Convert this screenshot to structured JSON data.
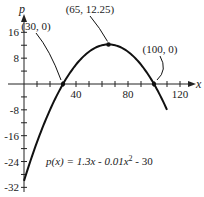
{
  "chart_data": {
    "type": "line",
    "title": "",
    "xlabel": "x",
    "ylabel": "p",
    "function": "p(x) = 1.3x - 0.01x^2 - 30",
    "equation_label": {
      "prefix": "p(x) = 1.3x - 0.01x",
      "exp": "2",
      "suffix": " - 30"
    },
    "xlim": [
      0,
      125
    ],
    "ylim": [
      -32,
      18
    ],
    "x_ticks": [
      10,
      20,
      30,
      40,
      50,
      60,
      70,
      80,
      90,
      100,
      110,
      120
    ],
    "x_tick_labels": [
      {
        "value": 40,
        "label": "40"
      },
      {
        "value": 80,
        "label": "80"
      },
      {
        "value": 120,
        "label": "120"
      }
    ],
    "y_ticks": [
      16,
      12,
      8,
      4,
      -4,
      -8,
      -12,
      -16,
      -20,
      -24,
      -28,
      -32
    ],
    "y_tick_labels": [
      {
        "value": 16,
        "label": "16"
      },
      {
        "value": 8,
        "label": "8"
      },
      {
        "value": -8,
        "label": "-8"
      },
      {
        "value": -16,
        "label": "-16"
      },
      {
        "value": -24,
        "label": "-24"
      },
      {
        "value": -32,
        "label": "-32"
      }
    ],
    "x": [
      0,
      10,
      20,
      30,
      40,
      50,
      60,
      65,
      70,
      80,
      90,
      100,
      110
    ],
    "series": [
      {
        "name": "p(x)",
        "values": [
          -30,
          -18,
          -8,
          0,
          6,
          10,
          12,
          12.25,
          12,
          10,
          6,
          0,
          -8
        ]
      }
    ],
    "annotations": [
      {
        "label": "(30, 0)",
        "x": 30,
        "y": 0
      },
      {
        "label": "(65, 12.25)",
        "x": 65,
        "y": 12.25
      },
      {
        "label": "(100, 0)",
        "x": 100,
        "y": 0
      }
    ],
    "grid": false,
    "legend": "none"
  }
}
